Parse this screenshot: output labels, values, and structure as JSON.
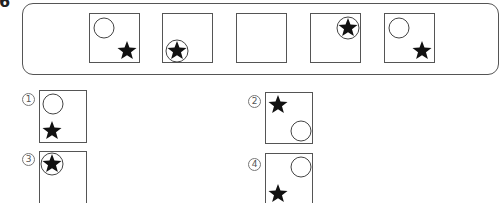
{
  "question": {
    "number": "6"
  },
  "sequence": {
    "boxes": [
      {
        "index": 1,
        "content": "circle-top-left, star-bottom-right",
        "circle": {
          "cx": 14,
          "cy": 14,
          "r": 10
        },
        "star": {
          "cx": 37,
          "cy": 37,
          "r": 10
        },
        "star_in_circle": false
      },
      {
        "index": 2,
        "content": "star-inside-circle, bottom-left",
        "circle": {
          "cx": 14,
          "cy": 37,
          "r": 11
        },
        "star": {
          "cx": 14,
          "cy": 37,
          "r": 10
        },
        "star_in_circle": true
      },
      {
        "index": 3,
        "content": "empty (blank to be answered)",
        "blank": true
      },
      {
        "index": 4,
        "content": "star-inside-circle, top-right",
        "circle": {
          "cx": 37,
          "cy": 14,
          "r": 11
        },
        "star": {
          "cx": 37,
          "cy": 14,
          "r": 10
        },
        "star_in_circle": true
      },
      {
        "index": 5,
        "content": "circle-top-left, star-bottom-right",
        "circle": {
          "cx": 14,
          "cy": 14,
          "r": 10
        },
        "star": {
          "cx": 37,
          "cy": 37,
          "r": 10
        },
        "star_in_circle": false
      }
    ]
  },
  "options": [
    {
      "label": "①",
      "number": "1",
      "content": "circle-top-left, star-bottom-left",
      "circle": {
        "cx": 13,
        "cy": 13,
        "r": 10
      },
      "star": {
        "cx": 12,
        "cy": 40,
        "r": 10
      }
    },
    {
      "label": "②",
      "number": "2",
      "content": "star-top-left, circle-bottom-right",
      "star": {
        "cx": 12,
        "cy": 12,
        "r": 10
      },
      "circle": {
        "cx": 35,
        "cy": 38,
        "r": 10
      }
    },
    {
      "label": "③",
      "number": "3",
      "content": "star-inside-circle, top-left",
      "circle": {
        "cx": 12,
        "cy": 12,
        "r": 11
      },
      "star": {
        "cx": 12,
        "cy": 12,
        "r": 10
      }
    },
    {
      "label": "④",
      "number": "4",
      "content": "circle-top-right, star-bottom-left",
      "circle": {
        "cx": 35,
        "cy": 13,
        "r": 10
      },
      "star": {
        "cx": 12,
        "cy": 40,
        "r": 10
      }
    }
  ],
  "colors": {
    "stroke": "#555555",
    "star_fill": "#111111",
    "circle_stroke": "#444444"
  }
}
